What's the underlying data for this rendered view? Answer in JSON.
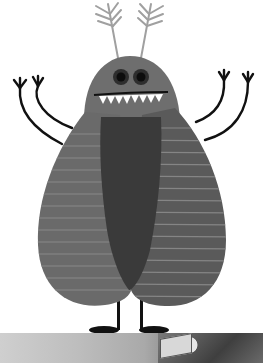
{
  "illustration": {
    "subject": "cartoon bug monster",
    "colors": {
      "body_gray": "#6e6e6e",
      "wing_dark": "#5c5c5c",
      "belly": "#3a3a3a",
      "stripe": "#8a8a8a",
      "limbs": "#111111",
      "antenna": "#9a9a9a",
      "teeth": "#ffffff"
    }
  },
  "photo_strip": {
    "description": "blurred grayscale photo with vehicle"
  }
}
